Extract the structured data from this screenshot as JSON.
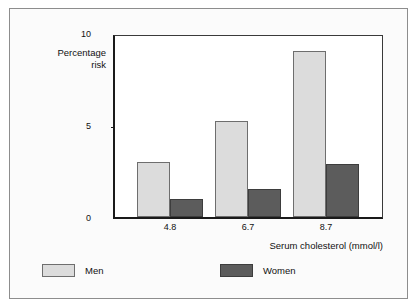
{
  "chart_data": {
    "type": "bar",
    "title": "",
    "xlabel": "Serum cholesterol (mmol/l)",
    "ylabel": "Percentage risk",
    "categories": [
      "4.8",
      "6.7",
      "8.7"
    ],
    "series": [
      {
        "name": "Men",
        "values": [
          3.0,
          5.2,
          9.0
        ],
        "color": "#dcdcdc"
      },
      {
        "name": "Women",
        "values": [
          1.0,
          1.5,
          2.9
        ],
        "color": "#5c5c5c"
      }
    ],
    "ylim": [
      0,
      10
    ],
    "yticks": [
      "0",
      "5",
      "10"
    ],
    "grid": false,
    "legend_position": "bottom"
  },
  "axis": {
    "y_label_line1": "Percentage",
    "y_label_line2": "risk",
    "y_tick_10": "10",
    "y_tick_5": "5",
    "y_tick_0": "0",
    "x_tick_1": "4.8",
    "x_tick_2": "6.7",
    "x_tick_3": "8.7",
    "x_title": "Serum cholesterol (mmol/l)"
  },
  "legend": {
    "men_label": "Men",
    "women_label": "Women"
  }
}
